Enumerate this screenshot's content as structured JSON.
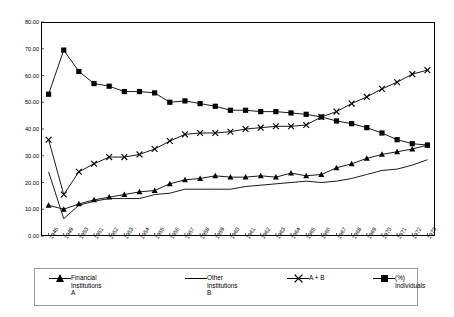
{
  "chart_data": {
    "type": "line",
    "title": "",
    "subtitle": "",
    "xlabel": "",
    "ylabel": "",
    "ylim": [
      0,
      80
    ],
    "ytick_step": 10,
    "ytick_labels": [
      "0.00",
      "10.00",
      "20.00",
      "30.00",
      "40.00",
      "50.00",
      "60.00",
      "70.00",
      "80.00"
    ],
    "grid": false,
    "legend_position": "bottom",
    "x_is_categorical": true,
    "categories": [
      "1945",
      "1949",
      "1950",
      "1951",
      "1952",
      "1953",
      "1954",
      "1955",
      "1956",
      "1957",
      "1958",
      "1959",
      "1960",
      "1961",
      "1962",
      "1963",
      "1964",
      "1965",
      "1966",
      "1967",
      "1968",
      "1969",
      "1970",
      "1971",
      "1972",
      "1973"
    ],
    "series": [
      {
        "name": "Financial Institutions A",
        "legend_label_line1": "Financial",
        "legend_label_line2": "Institutions",
        "legend_label_line3": "A",
        "marker": "triangle",
        "color": "#000000",
        "values": [
          11.5,
          10.0,
          12.0,
          13.5,
          14.5,
          15.5,
          16.5,
          17.0,
          19.5,
          21.0,
          21.5,
          22.5,
          22.0,
          22.0,
          22.5,
          22.0,
          23.5,
          22.5,
          23.0,
          25.5,
          27.0,
          29.0,
          30.5,
          31.5,
          32.5,
          34.0
        ]
      },
      {
        "name": "Other Institutions B",
        "legend_label_line1": "Other",
        "legend_label_line2": "Institutions",
        "legend_label_line3": "B",
        "marker": "none",
        "color": "#000000",
        "values": [
          24.0,
          6.5,
          11.5,
          13.0,
          14.0,
          14.0,
          14.0,
          15.5,
          16.0,
          17.5,
          17.5,
          17.5,
          17.5,
          18.5,
          19.0,
          19.5,
          20.0,
          20.5,
          20.0,
          20.5,
          21.5,
          23.0,
          24.5,
          25.0,
          26.5,
          28.5
        ]
      },
      {
        "name": "A + B",
        "legend_label_line1": "A + B",
        "legend_label_line2": "",
        "legend_label_line3": "",
        "marker": "x",
        "color": "#000000",
        "values": [
          36.0,
          15.5,
          24.0,
          27.0,
          29.5,
          29.5,
          30.5,
          32.5,
          35.5,
          38.0,
          38.5,
          38.5,
          39.0,
          40.0,
          40.5,
          41.0,
          41.0,
          41.5,
          44.5,
          46.5,
          49.5,
          52.0,
          55.0,
          57.5,
          60.5,
          62.0
        ]
      },
      {
        "name": "(%) Individuals",
        "legend_label_line1": "(%)",
        "legend_label_line2": "Individuals",
        "legend_label_line3": "",
        "marker": "square",
        "color": "#000000",
        "values": [
          53.0,
          69.5,
          61.5,
          57.0,
          56.0,
          54.0,
          54.0,
          53.5,
          50.0,
          50.5,
          49.5,
          48.5,
          47.0,
          47.0,
          46.5,
          46.5,
          46.0,
          45.5,
          44.5,
          43.0,
          42.0,
          40.5,
          38.5,
          36.0,
          34.5,
          34.0
        ]
      }
    ]
  }
}
